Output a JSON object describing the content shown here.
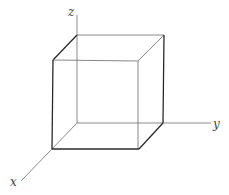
{
  "figure": {
    "type": "3d-axes-cube",
    "axes": [
      {
        "name": "x",
        "label": "x"
      },
      {
        "name": "y",
        "label": "y"
      },
      {
        "name": "z",
        "label": "z"
      }
    ]
  },
  "labels": {
    "x": "x",
    "y": "y",
    "z": "z"
  },
  "colors": {
    "axis": "#8a8a8a",
    "edge_front": "#2a2a2a",
    "edge_back": "#7a7a7a",
    "background": "#ffffff"
  }
}
